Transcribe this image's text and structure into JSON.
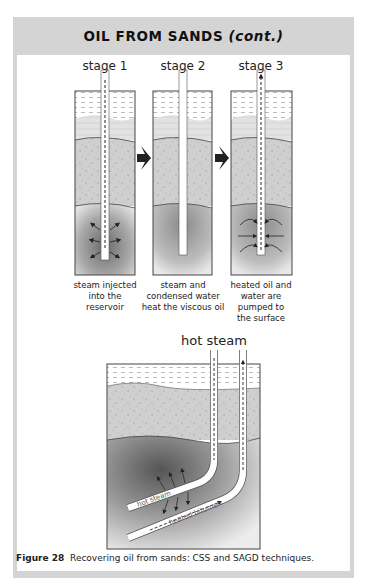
{
  "header": {
    "title_main": "OIL FROM SANDS ",
    "title_cont": "(cont.)"
  },
  "css_stages": [
    {
      "label": "stage 1",
      "caption": [
        "steam injected",
        "into the",
        "reservoir"
      ]
    },
    {
      "label": "stage 2",
      "caption": [
        "steam and",
        "condensed water",
        "heat the viscous oil"
      ]
    },
    {
      "label": "stage 3",
      "caption": [
        "heated oil and",
        "water are",
        "pumped to",
        "the surface"
      ]
    }
  ],
  "sagd": {
    "top_label": "hot steam",
    "pipe_upper_label": "hot steam",
    "pipe_lower_label": "heated bitumen"
  },
  "figure_caption": {
    "number": "Figure 28",
    "text": "Recovering oil from sands: CSS and SAGD techniques."
  },
  "colors": {
    "frame_gray": "#d4d4d4",
    "water_layer": "#ffffff",
    "sand_layer": "#cfcfcf",
    "reservoir_dark": "#7a7a7a",
    "arrow": "#222222"
  }
}
